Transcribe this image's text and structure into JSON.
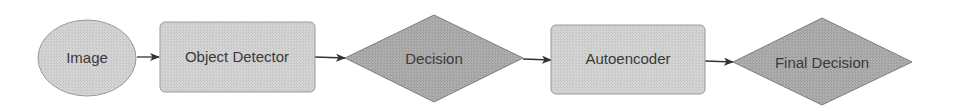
{
  "diagram": {
    "type": "flowchart",
    "direction": "left-to-right",
    "colors": {
      "light_fill": "#cfcfcf",
      "dark_fill": "#a8a8a8",
      "stroke": "#8a8a8a",
      "text": "#3a3a3a",
      "arrow": "#333333"
    },
    "nodes": [
      {
        "id": "image",
        "shape": "ellipse",
        "label": "Image"
      },
      {
        "id": "object_detector",
        "shape": "rounded-rectangle",
        "label": "Object Detector"
      },
      {
        "id": "decision",
        "shape": "diamond",
        "label": "Decision"
      },
      {
        "id": "autoencoder",
        "shape": "rounded-rectangle",
        "label": "Autoencoder"
      },
      {
        "id": "final_decision",
        "shape": "diamond",
        "label": "Final Decision"
      }
    ],
    "edges": [
      {
        "from": "image",
        "to": "object_detector"
      },
      {
        "from": "object_detector",
        "to": "decision"
      },
      {
        "from": "decision",
        "to": "autoencoder"
      },
      {
        "from": "autoencoder",
        "to": "final_decision"
      }
    ]
  }
}
